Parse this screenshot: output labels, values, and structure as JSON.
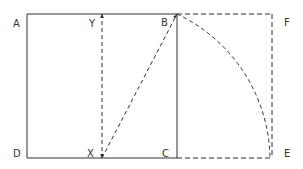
{
  "diagram": {
    "type": "golden-rectangle-construction",
    "points": {
      "A": {
        "label": "A",
        "x": 27,
        "y": 14
      },
      "Y": {
        "label": "Y",
        "x": 102,
        "y": 14
      },
      "B": {
        "label": "B",
        "x": 177,
        "y": 14
      },
      "F": {
        "label": "F",
        "x": 272,
        "y": 14
      },
      "D": {
        "label": "D",
        "x": 27,
        "y": 158
      },
      "X": {
        "label": "X",
        "x": 102,
        "y": 158
      },
      "C": {
        "label": "C",
        "x": 177,
        "y": 158
      },
      "E": {
        "label": "E",
        "x": 272,
        "y": 158
      }
    },
    "labels": {
      "A": "A",
      "Y": "Y",
      "B": "B",
      "F": "F",
      "D": "D",
      "X": "X",
      "C": "C",
      "E": "E"
    },
    "edges": [
      {
        "from": "A",
        "to": "B",
        "style": "solid"
      },
      {
        "from": "A",
        "to": "D",
        "style": "solid"
      },
      {
        "from": "D",
        "to": "C",
        "style": "solid"
      },
      {
        "from": "B",
        "to": "C",
        "style": "solid"
      },
      {
        "from": "Y",
        "to": "X",
        "style": "dashed"
      },
      {
        "from": "X",
        "to": "B",
        "style": "dashed"
      },
      {
        "from": "B",
        "to": "F",
        "style": "dashed"
      },
      {
        "from": "F",
        "to": "E",
        "style": "dashed"
      },
      {
        "from": "C",
        "to": "E",
        "style": "dashed"
      },
      {
        "from": "B",
        "to": "E",
        "style": "dashed-arc",
        "center": "X"
      }
    ],
    "colors": {
      "stroke": "#333333",
      "background": "#ffffff"
    }
  }
}
